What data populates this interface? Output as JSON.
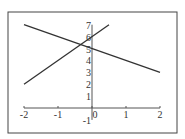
{
  "chart_data": {
    "type": "line",
    "title": "",
    "xlabel": "",
    "ylabel": "",
    "xlim": [
      -2,
      2
    ],
    "ylim": [
      -1,
      7
    ],
    "grid": false,
    "legend": null,
    "x_ticks": [
      "-2",
      "-1",
      "0",
      "1",
      "2"
    ],
    "y_ticks": [
      "-1",
      "1",
      "2",
      "3",
      "4",
      "5",
      "6",
      "7"
    ],
    "series": [
      {
        "name": "y = 5 - x",
        "x": [
          -2,
          2
        ],
        "y": [
          7,
          3
        ]
      },
      {
        "name": "y = 2x + 6",
        "x": [
          -2,
          0.5
        ],
        "y": [
          2,
          7
        ]
      }
    ],
    "annotations": [],
    "colors": {
      "line": "#333333",
      "axis": "#555555",
      "frame": "#444444"
    }
  }
}
